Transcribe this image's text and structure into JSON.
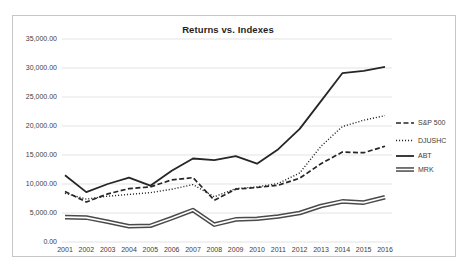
{
  "chart_data": {
    "type": "line",
    "title": "Returns vs. Indexes",
    "x": [
      "2001",
      "2002",
      "2003",
      "2004",
      "2005",
      "2006",
      "2007",
      "2008",
      "2009",
      "2010",
      "2011",
      "2012",
      "2013",
      "2014",
      "2015",
      "2016"
    ],
    "series": [
      {
        "name": "S&P 500",
        "style": "dashed",
        "values": [
          8700,
          6900,
          8300,
          9200,
          9500,
          10700,
          11100,
          7200,
          9100,
          9400,
          9800,
          11000,
          13500,
          15500,
          15400,
          16500
        ]
      },
      {
        "name": "DJUSHC",
        "style": "dotted",
        "values": [
          8400,
          7400,
          7900,
          8200,
          8500,
          9100,
          9900,
          7800,
          9200,
          9500,
          10100,
          11900,
          16500,
          19900,
          21000,
          21800
        ]
      },
      {
        "name": "ABT",
        "style": "solid",
        "values": [
          11500,
          8600,
          10000,
          11100,
          9700,
          12300,
          14400,
          14100,
          14800,
          13500,
          16000,
          19500,
          24300,
          29100,
          29500,
          30200
        ]
      },
      {
        "name": "MRK",
        "style": "thick-double",
        "values": [
          4300,
          4200,
          3500,
          2700,
          2800,
          4100,
          5500,
          3000,
          3900,
          4000,
          4400,
          5000,
          6200,
          7000,
          6800,
          7700
        ]
      }
    ],
    "ylim": [
      0,
      35000
    ],
    "ytick_step": 5000,
    "ytick_labels": [
      "0.00",
      "5,000.00",
      "10,000.00",
      "15,000.00",
      "20,000.00",
      "25,000.00",
      "30,000.00",
      "35,000.00"
    ],
    "grid": true,
    "legend_position": "right",
    "colors": {
      "line": "#262626",
      "mrk_outer": "#4a4a4a",
      "mrk_core": "#ffffff",
      "grid": "#dcdcdc",
      "labels": "#404040",
      "border": "#c6c6c6"
    }
  }
}
